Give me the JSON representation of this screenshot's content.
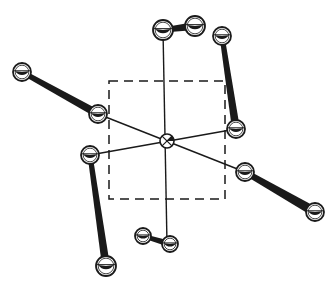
{
  "diagram": {
    "title": "",
    "colors": {
      "ink": "#1a1a1a",
      "background": "#ffffff"
    },
    "unit_cell": {
      "x": 109,
      "y": 81,
      "width": 116,
      "height": 118,
      "dash": "9 6"
    },
    "center_atom": {
      "x": 167,
      "y": 141,
      "r": 7
    },
    "thin_bonds": [
      {
        "x1": 163,
        "y1": 30,
        "x2": 167,
        "y2": 244
      },
      {
        "x1": 98,
        "y1": 114,
        "x2": 245,
        "y2": 172
      },
      {
        "x1": 90,
        "y1": 155,
        "x2": 236,
        "y2": 129
      }
    ],
    "molecules": [
      {
        "name": "top",
        "a": {
          "x": 163,
          "y": 30,
          "r": 10
        },
        "b": {
          "x": 195,
          "y": 26,
          "r": 10
        },
        "bond_width": 5
      },
      {
        "name": "upper-left",
        "a": {
          "x": 22,
          "y": 72,
          "r": 9
        },
        "b": {
          "x": 98,
          "y": 114,
          "r": 9
        },
        "bond_width": 5
      },
      {
        "name": "upper-right",
        "a": {
          "x": 222,
          "y": 36,
          "r": 9
        },
        "b": {
          "x": 236,
          "y": 129,
          "r": 9
        },
        "bond_width": 5
      },
      {
        "name": "left-vertical",
        "a": {
          "x": 90,
          "y": 155,
          "r": 9
        },
        "b": {
          "x": 106,
          "y": 266,
          "r": 10
        },
        "bond_width": 5
      },
      {
        "name": "lower-right",
        "a": {
          "x": 245,
          "y": 172,
          "r": 9
        },
        "b": {
          "x": 315,
          "y": 212,
          "r": 9
        },
        "bond_width": 6
      },
      {
        "name": "bottom",
        "a": {
          "x": 143,
          "y": 236,
          "r": 8
        },
        "b": {
          "x": 170,
          "y": 244,
          "r": 8
        },
        "bond_width": 4
      }
    ]
  }
}
